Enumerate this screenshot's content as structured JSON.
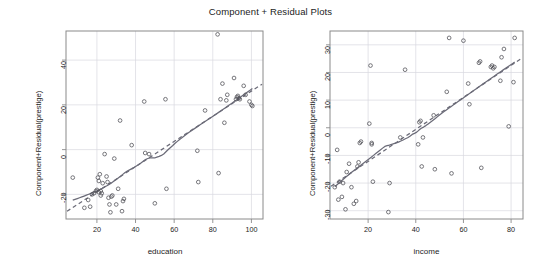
{
  "figure": {
    "title": "Component + Residual Plots",
    "background": "#ffffff",
    "frame_color": "#8a8a8a",
    "grid_color": "#d9d9e0",
    "point_color": "#55555c",
    "line_color": "#6b6b78",
    "text_color": "#1c1c1c"
  },
  "chart_data": [
    {
      "type": "scatter",
      "panel": "education",
      "title": "Component + Residual Plots",
      "xlabel": "education",
      "ylabel": "Component+Residual(prestige)",
      "xlim": [
        4,
        106
      ],
      "ylim": [
        -31,
        53
      ],
      "xticks": [
        20,
        40,
        60,
        80,
        100
      ],
      "yticks": [
        -20,
        0,
        20,
        40
      ],
      "grid": true,
      "legend": null,
      "x": [
        7.5,
        13.5,
        15.5,
        16.5,
        17.5,
        18.5,
        19.5,
        20.0,
        20.5,
        21.0,
        21.0,
        21.5,
        22.0,
        22.0,
        22.5,
        23.0,
        24.0,
        25.0,
        25.5,
        26.0,
        26.5,
        27.0,
        27.5,
        28.0,
        29.0,
        30.0,
        31.0,
        32.0,
        33.0,
        33.5,
        34.0,
        38.0,
        44.5,
        45.0,
        47.0,
        50.0,
        55.5,
        56.0,
        72.0,
        72.5,
        76.0,
        82.5,
        83.0,
        84.0,
        85.0,
        86.0,
        87.0,
        87.5,
        91.0,
        92.0,
        92.5,
        93.0,
        93.5,
        94.0,
        96.0,
        97.0,
        99.0,
        100.0,
        100.5
      ],
      "y": [
        -12.5,
        -26.0,
        -22.5,
        -25.5,
        -20.0,
        -19.5,
        -18.5,
        -18.0,
        -12.5,
        -14.0,
        -19.0,
        -11.0,
        -20.5,
        -18.5,
        -19.5,
        -15.0,
        -2.0,
        -12.0,
        -14.5,
        -21.5,
        -24.5,
        -28.0,
        -21.0,
        -20.5,
        -4.0,
        -24.5,
        -17.5,
        13.0,
        -27.5,
        -23.0,
        -22.0,
        2.0,
        21.5,
        -1.5,
        -2.0,
        -24.0,
        22.5,
        -17.5,
        -0.5,
        -14.5,
        17.5,
        51.5,
        -10.5,
        22.5,
        29.5,
        12.0,
        22.0,
        24.5,
        32.0,
        22.5,
        23.5,
        24.0,
        23.0,
        22.5,
        28.5,
        24.5,
        21.5,
        20.0,
        19.5
      ],
      "loess_label": "smoothed (solid)",
      "linear_label": "partial residual line (dashed)"
    },
    {
      "type": "scatter",
      "panel": "income",
      "title": "Component + Residual Plots",
      "xlabel": "income",
      "ylabel": "Component+Residual(prestige)",
      "xlim": [
        4,
        85
      ],
      "ylim": [
        -33,
        35
      ],
      "xticks": [
        20,
        40,
        60,
        80
      ],
      "yticks": [
        -30,
        -20,
        -10,
        0,
        10,
        20,
        30
      ],
      "grid": true,
      "legend": null,
      "x": [
        6.0,
        7.0,
        7.5,
        8.0,
        9.0,
        9.5,
        10.5,
        11.0,
        12.0,
        13.0,
        14.0,
        15.0,
        15.5,
        16.0,
        16.5,
        17.0,
        20.5,
        21.0,
        21.5,
        21.5,
        22.0,
        28.5,
        29.0,
        33.5,
        35.5,
        41.0,
        41.5,
        42.0,
        42.5,
        43.0,
        47.5,
        48.0,
        53.0,
        54.0,
        55.0,
        60.0,
        62.0,
        62.5,
        66.5,
        67.0,
        67.5,
        71.5,
        72.0,
        72.5,
        73.0,
        75.5,
        76.0,
        77.0,
        79.0,
        81.0,
        81.5
      ],
      "y": [
        -21.5,
        -8.0,
        -26.0,
        -19.5,
        -25.0,
        -20.0,
        -29.5,
        -16.0,
        -13.0,
        -21.5,
        -27.5,
        -26.5,
        -14.0,
        -12.5,
        -5.5,
        -5.0,
        1.5,
        22.5,
        -5.5,
        -6.0,
        -19.5,
        -30.5,
        -20.0,
        -3.5,
        21.0,
        -6.0,
        2.0,
        2.5,
        -14.0,
        -3.5,
        4.5,
        -15.0,
        13.0,
        32.5,
        -16.5,
        31.5,
        16.0,
        8.5,
        23.5,
        24.0,
        -14.5,
        22.0,
        22.5,
        21.5,
        22.0,
        17.0,
        25.5,
        28.5,
        0.5,
        16.5,
        32.5
      ],
      "loess_label": "smoothed (solid)",
      "linear_label": "partial residual line (dashed)"
    }
  ],
  "panels": {
    "education": {
      "xlabel": "education",
      "ylabel": "Component+Residual(prestige)",
      "xtick_labels": [
        "20",
        "40",
        "60",
        "80",
        "100"
      ],
      "ytick_labels": [
        "-20",
        "0",
        "20",
        "40"
      ]
    },
    "income": {
      "xlabel": "income",
      "ylabel": "Component+Residual(prestige)",
      "xtick_labels": [
        "20",
        "40",
        "60",
        "80"
      ],
      "ytick_labels": [
        "-30",
        "-20",
        "-10",
        "0",
        "10",
        "20",
        "30"
      ]
    }
  }
}
